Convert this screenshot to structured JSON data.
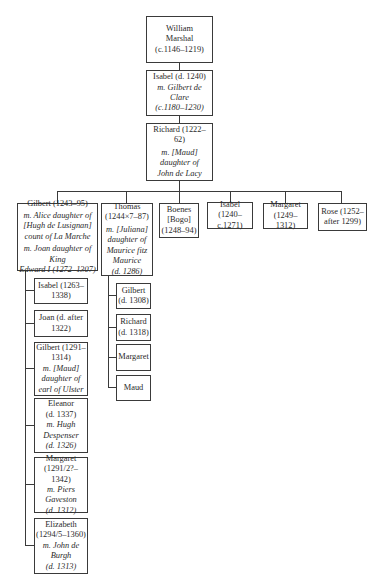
{
  "root": {
    "name": "William Marshal",
    "name_l1": "William",
    "name_l2": "Marshal",
    "dates": "(c.1146–1219)"
  },
  "gen2": {
    "name": "Isabel (d. 1240)",
    "spouse_l1": "m. Gilbert de",
    "spouse_l2": "Clare",
    "spouse_dates": "(c.1180–1230)"
  },
  "gen3": {
    "name": "Richard (1222–62)",
    "spouse_l1": "m. [Maud]",
    "spouse_l2": "daughter of",
    "spouse_l3": "John de Lacy"
  },
  "children": [
    {
      "name": "Gilbert (1243–95)",
      "spouse1_l1": "m. Alice daughter of",
      "spouse1_l2": "[Hugh de Lusignan]",
      "spouse1_l3": "count of La Marche",
      "spouse2_l1": "m. Joan daughter of King",
      "spouse2_l2": "Edward I (1272–1307)",
      "children": [
        {
          "l1": "Isabel (1263–",
          "l2": "1338)"
        },
        {
          "l1": "Joan (d. after",
          "l2": "1322)"
        },
        {
          "l1": "Gilbert (1291–",
          "l2": "1314)",
          "s1": "m. [Maud]",
          "s2": "daughter of",
          "s3": "earl of Ulster"
        },
        {
          "l1": "Eleanor",
          "l2": "(d. 1337)",
          "s1": "m. Hugh",
          "s2": "Despenser",
          "s3": "(d. 1326)"
        },
        {
          "l1": "Margaret",
          "l2": "(1291/2?–1342)",
          "s1": "m. Piers",
          "s2": "Gaveston",
          "s3": "(d. 1312)"
        },
        {
          "l1": "Elizabeth",
          "l2": "(1294/5–1360)",
          "s1": "m. John de",
          "s2": "Burgh",
          "s3": "(d. 1313)"
        }
      ]
    },
    {
      "name_l1": "Thomas",
      "name_l2": "(1244×7–87)",
      "spouse_l1": "m. [Juliana]",
      "spouse_l2": "daughter of",
      "spouse_l3": "Maurice fitz",
      "spouse_l4": "Maurice",
      "spouse_l5": "(d. 1286)",
      "children": [
        {
          "l1": "Gilbert",
          "l2": "(d. 1308)"
        },
        {
          "l1": "Richard",
          "l2": "(d. 1318)"
        },
        {
          "l1": "Margaret"
        },
        {
          "l1": "Maud"
        }
      ]
    },
    {
      "l1": "Boenes",
      "l2": "[Bogo]",
      "l3": "(1248–94)"
    },
    {
      "l1": "Isabel (1240–",
      "l2": "c.1271)"
    },
    {
      "l1": "Margaret",
      "l2": "(1249–1312)"
    },
    {
      "l1": "Rose (1252–",
      "l2": "after 1299)"
    }
  ]
}
